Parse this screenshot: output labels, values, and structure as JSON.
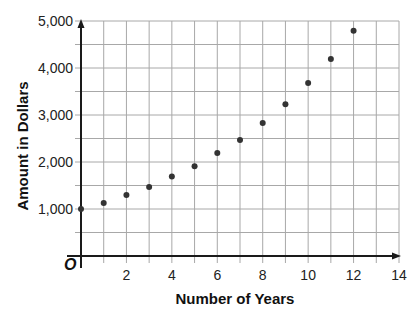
{
  "chart_data": {
    "type": "scatter",
    "title": "",
    "xlabel": "Number of Years",
    "ylabel": "Amount in Dollars",
    "origin_label": "O",
    "xlim": [
      0,
      14
    ],
    "ylim": [
      0,
      5000
    ],
    "grid": true,
    "x_grid_step": 1,
    "y_grid_step": 500,
    "x_ticks": [
      2,
      4,
      6,
      8,
      10,
      12,
      14
    ],
    "x_tick_labels": [
      "2",
      "4",
      "6",
      "8",
      "10",
      "12",
      "14"
    ],
    "y_ticks": [
      1000,
      2000,
      3000,
      4000,
      5000
    ],
    "y_tick_labels": [
      "1,000",
      "2,000",
      "3,000",
      "4,000",
      "5,000"
    ],
    "series": [
      {
        "name": "Amount",
        "color": "#333333",
        "x": [
          0,
          1,
          2,
          3,
          4,
          5,
          6,
          7,
          8,
          9,
          10,
          11,
          12
        ],
        "y": [
          1000,
          1130,
          1300,
          1470,
          1690,
          1910,
          2190,
          2470,
          2830,
          3230,
          3680,
          4190,
          4790
        ]
      }
    ]
  },
  "colors": {
    "grid": "#a8a8a8",
    "axis": "#1a1a1a",
    "point": "#333333"
  }
}
